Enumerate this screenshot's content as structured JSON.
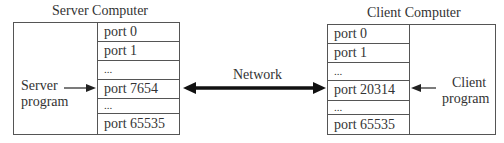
{
  "server": {
    "title": "Server Computer",
    "program_label_line1": "Server",
    "program_label_line2": "program",
    "ports": [
      "port 0",
      "port 1",
      "...",
      "port 7654",
      "...",
      "port 65535"
    ],
    "active_port_index": 3
  },
  "client": {
    "title": "Client Computer",
    "program_label_line1": "Client",
    "program_label_line2": "program",
    "ports": [
      "port 0",
      "port 1",
      "...",
      "port 20314",
      "...",
      "port 65535"
    ],
    "active_port_index": 3
  },
  "network": {
    "label": "Network"
  },
  "colors": {
    "line": "#555555",
    "arrow": "#111111",
    "text": "#333333"
  }
}
